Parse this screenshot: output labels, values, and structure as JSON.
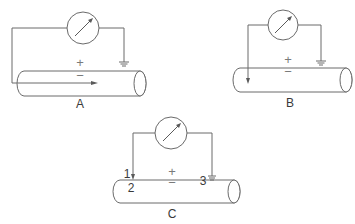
{
  "figure": {
    "panels": [
      {
        "id": "A",
        "label": "A",
        "plus": "+",
        "minus": "−",
        "electrode": "intracellular-longitudinal-arrow",
        "reference": "ground"
      },
      {
        "id": "B",
        "label": "B",
        "plus": "+",
        "minus": "−",
        "electrode": "intracellular-vertical-arrow",
        "reference": "ground"
      },
      {
        "id": "C",
        "label": "C",
        "plus": "+",
        "minus": "−",
        "electrode": "surface-electrode",
        "reference": "ground",
        "points": [
          "1",
          "2",
          "3"
        ]
      }
    ],
    "colors": {
      "line": "#6a6a6a",
      "text": "#3a3a3a",
      "background": "#ffffff"
    },
    "icons": {
      "meter": "galvanometer-icon",
      "ground": "ground-icon",
      "axon": "cylinder-axon-icon"
    }
  }
}
